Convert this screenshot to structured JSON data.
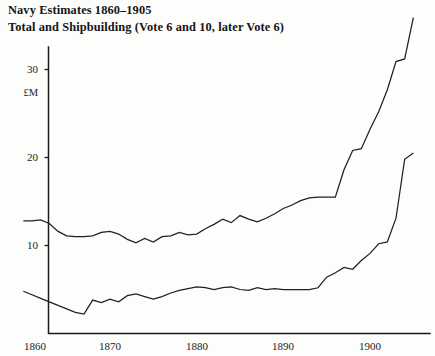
{
  "title": {
    "line1": "Navy Estimates 1860–1905",
    "line2": "Total and Shipbuilding (Vote 6 and 10, later Vote 6)"
  },
  "axes": {
    "y_unit_label": "£M",
    "y_ticks": [
      "10",
      "20",
      "30"
    ],
    "x_ticks": [
      "1860",
      "1870",
      "1880",
      "1890",
      "1900"
    ]
  },
  "chart_data": {
    "type": "line",
    "xlabel": "",
    "ylabel": "£M",
    "xlim": [
      1860,
      1905
    ],
    "ylim": [
      0,
      36
    ],
    "grid": false,
    "legend": "none",
    "x_ticks": [
      1860,
      1870,
      1880,
      1890,
      1900
    ],
    "y_ticks": [
      10,
      20,
      30
    ],
    "x": [
      1860,
      1861,
      1862,
      1863,
      1864,
      1865,
      1866,
      1867,
      1868,
      1869,
      1870,
      1871,
      1872,
      1873,
      1874,
      1875,
      1876,
      1877,
      1878,
      1879,
      1880,
      1881,
      1882,
      1883,
      1884,
      1885,
      1886,
      1887,
      1888,
      1889,
      1890,
      1891,
      1892,
      1893,
      1894,
      1895,
      1896,
      1897,
      1898,
      1899,
      1900,
      1901,
      1902,
      1903,
      1904,
      1905
    ],
    "series": [
      {
        "name": "Total",
        "values": [
          12.8,
          12.8,
          12.9,
          12.5,
          11.6,
          11.1,
          11.0,
          11.0,
          11.1,
          11.5,
          11.6,
          11.3,
          10.7,
          10.3,
          10.8,
          10.4,
          11.0,
          11.1,
          11.5,
          11.2,
          11.3,
          11.9,
          12.4,
          13.0,
          12.6,
          13.4,
          13.0,
          12.7,
          13.1,
          13.6,
          14.2,
          14.6,
          15.1,
          15.4,
          15.5,
          15.5,
          15.5,
          18.6,
          20.8,
          21.0,
          23.2,
          25.2,
          27.7,
          30.9,
          31.2,
          35.9
        ],
        "note": "upper curve — total navy estimates"
      },
      {
        "name": "Shipbuilding (Vote 6 and 10, later Vote 6)",
        "values": [
          4.8,
          4.4,
          4.0,
          3.6,
          3.2,
          2.8,
          2.4,
          2.2,
          3.8,
          3.5,
          3.9,
          3.6,
          4.3,
          4.5,
          4.2,
          3.9,
          4.2,
          4.6,
          4.9,
          5.1,
          5.3,
          5.2,
          5.0,
          5.2,
          5.3,
          5.0,
          4.9,
          5.2,
          5.0,
          5.1,
          5.0,
          5.0,
          5.0,
          5.0,
          5.2,
          6.4,
          6.9,
          7.5,
          7.3,
          8.3,
          9.1,
          10.2,
          10.4,
          13.1,
          19.8,
          20.5
        ],
        "note": "lower curve — shipbuilding vote"
      }
    ]
  },
  "colors": {
    "line": "#202020",
    "axis": "#1b1b1b",
    "background": "#fdfdfc",
    "text": "#151515"
  }
}
